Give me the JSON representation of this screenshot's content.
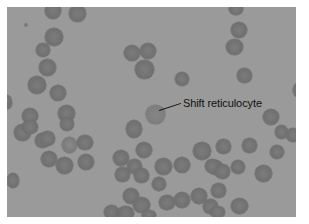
{
  "figure": {
    "background_color": "#9a9a9a",
    "cell_color": "#727272",
    "annotation": {
      "label": "Shift reticulocyte",
      "target_cell_center": [
        155,
        115
      ]
    }
  }
}
